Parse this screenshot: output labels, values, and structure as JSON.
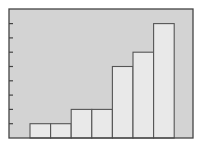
{
  "chart_data": {
    "type": "bar",
    "title": "",
    "xlabel": "",
    "ylabel": "",
    "categories": [
      "1",
      "2",
      "3",
      "4",
      "5",
      "6",
      "7"
    ],
    "values": [
      1,
      1,
      2,
      2,
      5,
      6,
      8
    ],
    "ylim": [
      0,
      9
    ],
    "yticks": [
      1,
      2,
      3,
      4,
      5,
      6,
      7,
      8
    ],
    "ytick_labels_visible": false,
    "xtick_labels_visible": false,
    "grid": false,
    "legend": null,
    "bar_gap": 0
  },
  "colors": {
    "plot_background": "#d3d3d3",
    "bar_fill": "#e9e9e9",
    "bar_stroke": "#555555",
    "frame_stroke": "#444444",
    "page_background": "#ffffff"
  },
  "layout": {
    "frame": {
      "x0": 9,
      "y0": 9,
      "x1": 193,
      "y1": 138
    },
    "bars_x_start": 30,
    "bar_width": 20.6,
    "unit_px": 14.3
  }
}
